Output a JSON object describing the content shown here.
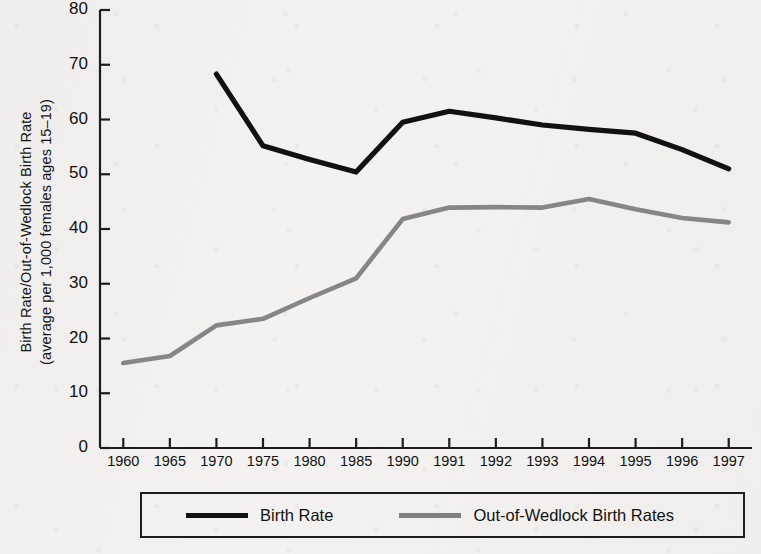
{
  "chart_data": {
    "type": "line",
    "title": "",
    "subtitle": "",
    "xlabel": "",
    "ylabel": "Birth Rate/Out-of-Wedlock Birth Rate (average per 1,000 females ages 15–19)",
    "ylabel_line1": "Birth Rate/Out-of-Wedlock Birth Rate",
    "ylabel_line2": "(average per 1,000 females ages 15–19)",
    "categories": [
      "1960",
      "1965",
      "1970",
      "1975",
      "1980",
      "1985",
      "1990",
      "1991",
      "1992",
      "1993",
      "1994",
      "1995",
      "1996",
      "1997"
    ],
    "x_tick_labels": [
      "1960",
      "1965",
      "1970",
      "1975",
      "1980",
      "1985",
      "1990",
      "1991",
      "1992",
      "1993",
      "1994",
      "1995",
      "1996",
      "1997"
    ],
    "y_tick_labels": [
      "0",
      "10",
      "20",
      "30",
      "40",
      "50",
      "60",
      "70",
      "80"
    ],
    "y_ticks": [
      0,
      10,
      20,
      30,
      40,
      50,
      60,
      70,
      80
    ],
    "ylim": [
      0,
      80
    ],
    "grid": false,
    "legend_position": "bottom",
    "series": [
      {
        "name": "Birth Rate",
        "color": "#111111",
        "values": [
          null,
          null,
          68.3,
          55.2,
          52.7,
          50.4,
          59.5,
          61.5,
          60.3,
          59.0,
          58.2,
          57.5,
          54.5,
          51.0
        ]
      },
      {
        "name": "Out-of-Wedlock Birth Rates",
        "color": "#808080",
        "values": [
          15.5,
          16.8,
          22.4,
          23.6,
          27.4,
          31.0,
          41.8,
          43.9,
          44.0,
          43.9,
          45.5,
          43.6,
          42.0,
          41.2
        ]
      }
    ]
  },
  "legend": {
    "items": [
      {
        "label": "Birth Rate",
        "color": "#111111"
      },
      {
        "label": "Out-of-Wedlock Birth Rates",
        "color": "#808080"
      }
    ]
  },
  "colors": {
    "background": "#f3f2f0",
    "axis": "#1d1d1d",
    "birth_rate": "#111111",
    "out_of_wedlock": "#808080"
  }
}
